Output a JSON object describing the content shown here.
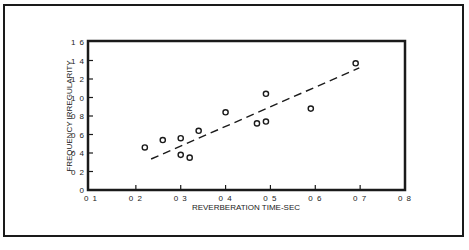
{
  "chart_data": {
    "type": "scatter",
    "title": "",
    "xlabel": "REVERBERATION TIME-SEC",
    "ylabel": "FREQUENCY IRREGULARITY",
    "xlim": [
      0.1,
      0.8
    ],
    "ylim": [
      0,
      1.6
    ],
    "x_ticks": [
      "0 1",
      "0 2",
      "0 3",
      "0 4",
      "0 5",
      "0 6",
      "0 7",
      "0 8"
    ],
    "y_ticks": [
      "0",
      "0 2",
      "0 4",
      "0 6",
      "0 8",
      "1 0",
      "1 2",
      "1 4",
      "1 6"
    ],
    "grid": false,
    "legend": null,
    "series": [
      {
        "name": "measurements",
        "marker": "open-circle",
        "points": [
          {
            "x": 0.22,
            "y": 0.46
          },
          {
            "x": 0.26,
            "y": 0.54
          },
          {
            "x": 0.3,
            "y": 0.56
          },
          {
            "x": 0.3,
            "y": 0.38
          },
          {
            "x": 0.32,
            "y": 0.35
          },
          {
            "x": 0.34,
            "y": 0.64
          },
          {
            "x": 0.4,
            "y": 0.84
          },
          {
            "x": 0.47,
            "y": 0.72
          },
          {
            "x": 0.49,
            "y": 0.74
          },
          {
            "x": 0.49,
            "y": 1.04
          },
          {
            "x": 0.59,
            "y": 0.88
          },
          {
            "x": 0.69,
            "y": 1.37
          }
        ]
      },
      {
        "name": "trend",
        "style": "dashed-line",
        "points": [
          {
            "x": 0.234,
            "y": 0.335
          },
          {
            "x": 0.698,
            "y": 1.32
          }
        ]
      }
    ]
  },
  "labels": {
    "xlabel": "REVERBERATION TIME-SEC",
    "ylabel": "FREQUENCY IRREGULARITY"
  },
  "colors": {
    "ink": "#1a1a1a",
    "background": "#ffffff"
  }
}
